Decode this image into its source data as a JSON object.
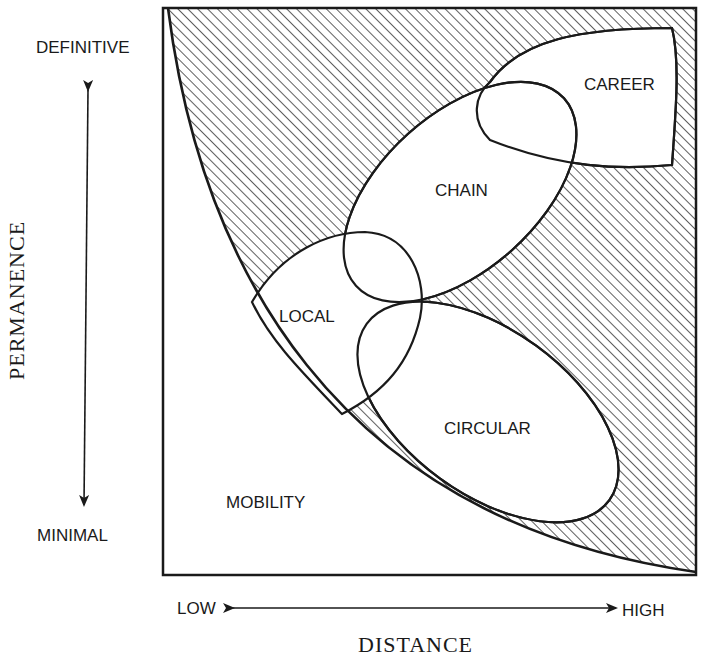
{
  "diagram": {
    "type": "conceptual-region-diagram",
    "axes": {
      "y": {
        "title": "PERMANENCE",
        "top_label": "DEFINITIVE",
        "bottom_label": "MINIMAL"
      },
      "x": {
        "title": "DISTANCE",
        "left_label": "LOW",
        "right_label": "HIGH"
      }
    },
    "regions": {
      "mobility": "MOBILITY",
      "local": "LOCAL",
      "chain": "CHAIN",
      "career": "CAREER",
      "circular": "CIRCULAR"
    },
    "colors": {
      "ink": "#1a1a1a",
      "background": "#ffffff"
    }
  }
}
